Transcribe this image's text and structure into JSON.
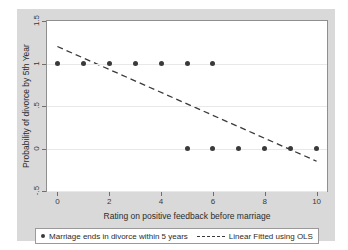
{
  "chart_data": {
    "type": "scatter",
    "title": "",
    "xlabel": "Rating on positive feedback before marriage",
    "ylabel": "Probability of divorce by 5th Year",
    "xlim": [
      -0.4,
      10.4
    ],
    "ylim": [
      -0.5,
      1.5
    ],
    "xticks": [
      "0",
      "2",
      "4",
      "6",
      "8",
      "10"
    ],
    "xtick_values": [
      0,
      2,
      4,
      6,
      8,
      10
    ],
    "yticks": [
      "1.5",
      "1",
      ".5",
      "0",
      "-.5"
    ],
    "ytick_values": [
      1.5,
      1,
      0.5,
      0,
      -0.5
    ],
    "grid": true,
    "legend_position": "bottom",
    "series": [
      {
        "name": "Marriage ends in divorce within 5 years",
        "type": "scatter",
        "marker": "filled-circle",
        "color": "#3a3a3a",
        "x": [
          0,
          1,
          2,
          3,
          4,
          5,
          6,
          5,
          6,
          7,
          8,
          9,
          10
        ],
        "y": [
          1,
          1,
          1,
          1,
          1,
          1,
          1,
          0,
          0,
          0,
          0,
          0,
          0
        ]
      },
      {
        "name": "Linear Fitted using OLS",
        "type": "line",
        "style": "dashed",
        "color": "#3a3a3a",
        "x": [
          0,
          10
        ],
        "y": [
          1.2,
          -0.15
        ]
      }
    ]
  },
  "axes": {
    "y_title": "Probability of divorce by 5th Year",
    "x_title": "Rating on positive feedback before marriage",
    "y_tick_labels": [
      "1.5",
      "1",
      ".5",
      "0",
      "-.5"
    ],
    "x_tick_labels": [
      "0",
      "2",
      "4",
      "6",
      "8",
      "10"
    ]
  },
  "legend": {
    "scatter_label": "Marriage ends in divorce within 5 years",
    "fit_label": "Linear Fitted using OLS"
  },
  "colors": {
    "graph_region": "#d9d9d9",
    "plot_background": "#ffffff",
    "marker": "#3a3a3a",
    "fit_line": "#3a3a3a",
    "gridline": "#e8e8e8",
    "frame": "#8f8f8f"
  }
}
